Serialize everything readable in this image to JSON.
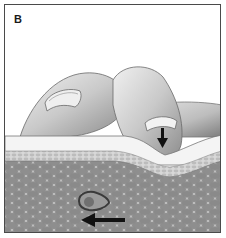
{
  "figure": {
    "panel_label": "B",
    "elements": {
      "pressure_arrow": "down-arrow",
      "movement_arrow": "left-arrow",
      "cell": "highlighted-cell"
    },
    "colors": {
      "border": "#4a4a4a",
      "finger": "#c8c8c8",
      "skin_surface": "#f2f2f2",
      "epidermis": "#cfcfcf",
      "tissue": "#8a8a8a",
      "cell_fill": "#9a9a9a",
      "arrow": "#111111"
    }
  }
}
